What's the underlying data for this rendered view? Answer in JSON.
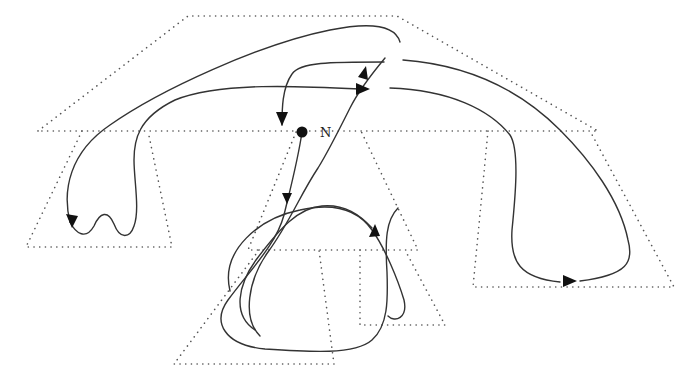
{
  "diagram": {
    "width": 690,
    "height": 388,
    "colors": {
      "background": "#ffffff",
      "region_stroke": "#555555",
      "curve_stroke": "#333333",
      "arrow_fill": "#111111"
    },
    "node": {
      "label": "N",
      "cx": 302,
      "cy": 132,
      "r": 5.5,
      "label_x": 320,
      "label_y": 137
    },
    "regions": [
      {
        "id": "top-polygon",
        "d": "M 38 131 L 188 16 L 397 16 L 598 131 Z"
      },
      {
        "id": "left-trapezoid",
        "d": "M 82 131 L 26 247 L 172 247 L 148 131"
      },
      {
        "id": "center-trapezoid",
        "d": "M 296 132 L 248 250 L 418 250 L 361 131"
      },
      {
        "id": "bottom-left-triangle",
        "d": "M 259 250 L 174 364 L 334 364 L 319 250"
      },
      {
        "id": "bottom-right-trapezoid",
        "d": "M 360 250 L 360 325 L 445 325 L 405 250"
      },
      {
        "id": "right-trapezoid",
        "d": "M 488 131 L 473 287 L 674 287 L 590 131"
      }
    ],
    "curves": [
      {
        "id": "outer-left-loop",
        "d": "M 400 42 C 395 25 370 22 330 30 C 260 44 160 90 110 125 C 70 152 62 190 70 222"
      },
      {
        "id": "left-wiggle",
        "d": "M 70 222 C 76 234 86 240 94 226 C 100 212 108 210 114 224 C 120 240 130 238 134 226 C 140 210 134 180 134 160 C 134 140 138 118 175 100 C 220 82 300 86 360 89"
      },
      {
        "id": "inner-top-to-node",
        "d": "M 384 62 C 330 62 300 62 292 74 C 282 88 282 110 282 125"
      },
      {
        "id": "node-to-bottom",
        "d": "M 302 132 C 298 160 290 190 284 215 C 276 245 250 270 228 300 C 212 322 224 345 265 349 C 310 352 355 355 372 340 C 388 326 388 300 387 272 C 385 240 386 220 398 208"
      },
      {
        "id": "central-up-strand",
        "d": "M 230 291 C 220 250 260 218 300 210 C 335 202 358 210 372 230 C 385 248 398 280 404 300 C 408 318 395 323 388 316"
      },
      {
        "id": "central-s-curve",
        "d": "M 260 336 C 242 318 248 280 268 252 C 290 222 300 195 318 168 C 328 152 340 128 350 108 C 360 88 375 70 385 58"
      },
      {
        "id": "right-outer",
        "d": "M 403 60 C 470 65 520 90 560 130 C 590 160 620 200 628 240 C 634 262 628 275 580 281"
      },
      {
        "id": "right-inner",
        "d": "M 390 88 C 450 90 490 110 510 135 C 520 150 515 200 512 230 C 510 262 520 278 560 282"
      },
      {
        "id": "bottom-loop",
        "d": "M 255 330 C 232 315 238 285 256 260 C 280 228 298 208 322 206 C 345 204 360 215 372 228"
      }
    ],
    "arrows": [
      {
        "id": "arrow-into-node",
        "points": "276,112 288,112 282,126"
      },
      {
        "id": "arrow-right-top",
        "points": "356,83 370,89 356,95"
      },
      {
        "id": "arrow-up-top",
        "points": "358,77 366,66 368,80"
      },
      {
        "id": "arrow-down-center",
        "points": "282,193 292,193 287,204"
      },
      {
        "id": "arrow-left-loop",
        "points": "66,214 78,216 72,228"
      },
      {
        "id": "arrow-center-up",
        "points": "369,237 375,224 380,236"
      },
      {
        "id": "arrow-right-bottom",
        "points": "563,275 577,281 563,287"
      }
    ]
  }
}
